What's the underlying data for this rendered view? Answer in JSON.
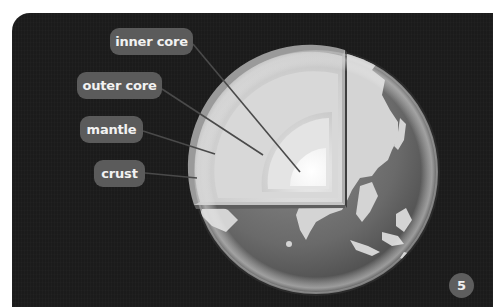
{
  "figure": {
    "page_number": "5",
    "colors": {
      "background": "#1b1b1b",
      "label_box": "#5b5b5b",
      "label_text": "#f2f2f2",
      "page_badge": "#5e5e5e",
      "ocean": "#6e6e6e",
      "land": "#d6d6d6",
      "inner_core": "#ffffff"
    }
  },
  "labels": [
    {
      "id": "inner-core",
      "text": "inner core"
    },
    {
      "id": "outer-core",
      "text": "outer core"
    },
    {
      "id": "mantle",
      "text": "mantle"
    },
    {
      "id": "crust",
      "text": "crust"
    }
  ]
}
